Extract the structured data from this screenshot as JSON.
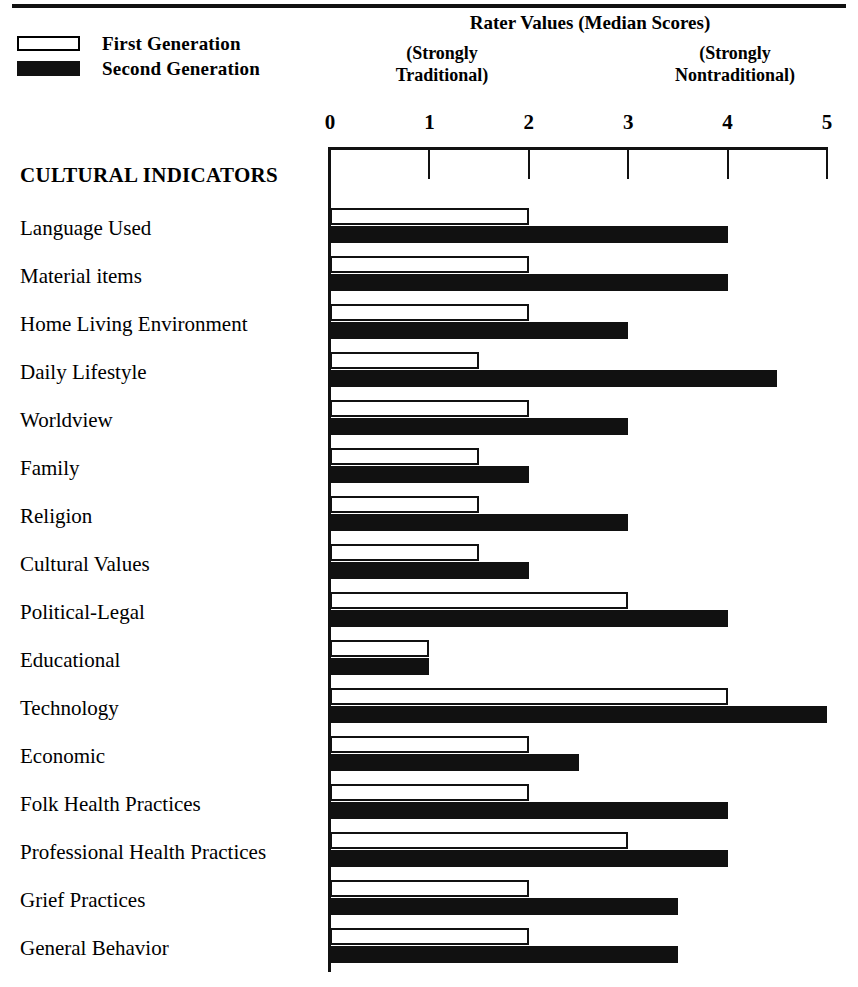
{
  "header": {
    "title": "Rater Values (Median Scores)",
    "anchor_low": "(Strongly\nTraditional)",
    "anchor_low_line1": "(Strongly",
    "anchor_low_line2": "Traditional)",
    "anchor_high_line1": "(Strongly",
    "anchor_high_line2": "Nontraditional)"
  },
  "legend": {
    "items": [
      {
        "label": "First Generation",
        "swatch": "open-rectangle",
        "color": "#ffffff"
      },
      {
        "label": "Second Generation",
        "swatch": "filled-rectangle",
        "color": "#111111"
      }
    ]
  },
  "section_heading": "CULTURAL INDICATORS",
  "chart_data": {
    "type": "bar",
    "orientation": "horizontal",
    "title": "Rater Values (Median Scores)",
    "xlabel": "Rater Values (Median Scores)",
    "ylabel": "CULTURAL INDICATORS",
    "xlim": [
      0,
      5
    ],
    "xticks": [
      0,
      1,
      2,
      3,
      4,
      5
    ],
    "xtick_labels": [
      "0",
      "1",
      "2",
      "3",
      "4",
      "5"
    ],
    "axis_anchor_low": "(Strongly Traditional)",
    "axis_anchor_high": "(Strongly Nontraditional)",
    "grid": false,
    "legend_position": "top-left",
    "categories": [
      "Language Used",
      "Material items",
      "Home Living Environment",
      "Daily Lifestyle",
      "Worldview",
      "Family",
      "Religion",
      "Cultural Values",
      "Political-Legal",
      "Educational",
      "Technology",
      "Economic",
      "Folk Health Practices",
      "Professional Health Practices",
      "Grief Practices",
      "General Behavior"
    ],
    "series": [
      {
        "name": "First Generation",
        "color": "#ffffff",
        "values": [
          2,
          2,
          2,
          1.5,
          2,
          1.5,
          1.5,
          1.5,
          3,
          1,
          4,
          2,
          2,
          3,
          2,
          2
        ]
      },
      {
        "name": "Second Generation",
        "color": "#111111",
        "values": [
          4,
          4,
          3,
          4.5,
          3,
          2,
          3,
          2,
          4,
          1,
          5,
          2.5,
          4,
          4,
          3.5,
          3.5
        ]
      }
    ]
  }
}
